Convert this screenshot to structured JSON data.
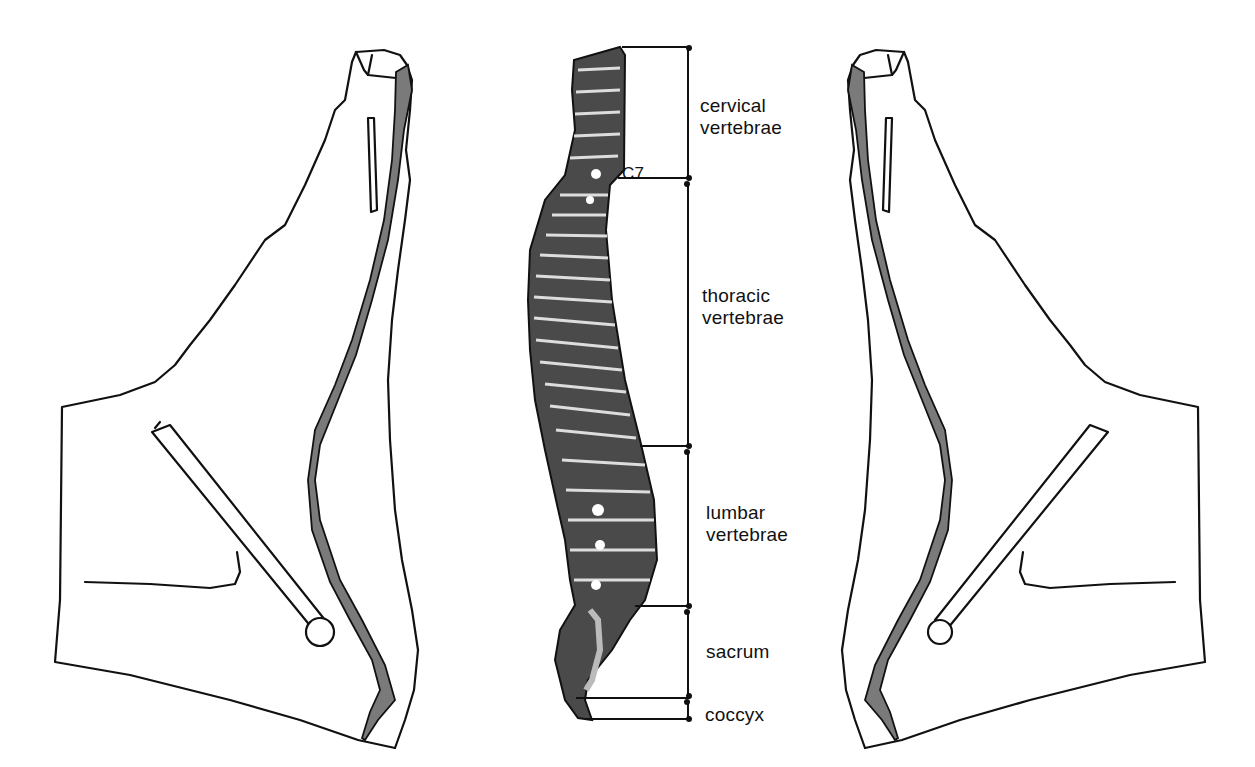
{
  "diagram": {
    "type": "anatomy",
    "colors": {
      "outline": "#111111",
      "spinal_band": "#7a7a7a",
      "background": "#ffffff"
    },
    "regions": [
      {
        "id": "cervical",
        "line1": "cervical",
        "line2": "vertebrae",
        "top_y": 47,
        "bottom_y": 178
      },
      {
        "id": "thoracic",
        "line1": "thoracic",
        "line2": "vertebrae",
        "top_y": 180,
        "bottom_y": 447
      },
      {
        "id": "lumbar",
        "line1": "lumbar",
        "line2": "vertebrae",
        "top_y": 448,
        "bottom_y": 607
      },
      {
        "id": "sacrum",
        "line1": "sacrum",
        "line2": "",
        "top_y": 609,
        "bottom_y": 699
      },
      {
        "id": "coccyx",
        "line1": "coccyx",
        "line2": "",
        "top_y": 700,
        "bottom_y": 720
      }
    ],
    "marker": {
      "label": "C7"
    },
    "figures": [
      {
        "id": "left-figure",
        "orientation": "facing-left"
      },
      {
        "id": "spine",
        "orientation": "center"
      },
      {
        "id": "right-figure",
        "orientation": "facing-right"
      }
    ]
  }
}
